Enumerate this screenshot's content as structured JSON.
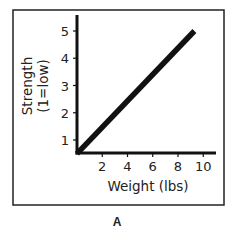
{
  "chart_data": {
    "type": "line",
    "title": "",
    "panel_label": "A",
    "xlabel": "Weight (lbs)",
    "ylabel_line1": "Strength",
    "ylabel_line2": "(1=low)",
    "x_ticks": [
      2,
      4,
      6,
      8,
      10
    ],
    "x_tick_labels": [
      "2",
      "4",
      "6",
      "8",
      "10"
    ],
    "y_ticks": [
      1,
      2,
      3,
      4,
      5
    ],
    "y_tick_labels": [
      "1",
      "2",
      "3",
      "4",
      "5"
    ],
    "xlim": [
      0,
      11
    ],
    "ylim": [
      0.5,
      5.5
    ],
    "grid": false,
    "legend": "none",
    "series": [
      {
        "name": "Strength vs Weight",
        "x": [
          0,
          9.3
        ],
        "y": [
          0.5,
          5
        ]
      }
    ]
  }
}
